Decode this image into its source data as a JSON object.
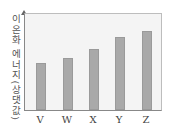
{
  "chart_data": {
    "type": "bar",
    "title": "",
    "xlabel": "",
    "ylabel": "이온화 에너지(상댓값)",
    "categories": [
      "V",
      "W",
      "X",
      "Y",
      "Z"
    ],
    "values": [
      49,
      54,
      64,
      76,
      82
    ],
    "ylim": [
      0,
      100
    ],
    "grid": false,
    "legend": null,
    "bar_color": "#a9a9a9",
    "plot_background": "#f4f4f4"
  }
}
